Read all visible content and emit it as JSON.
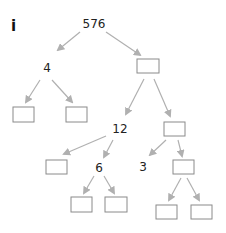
{
  "part_label": "i",
  "colors": {
    "edge": "#b0b0b0",
    "box_border": "#8a8a8a",
    "text": "#222222"
  },
  "nodes": {
    "root": "576",
    "left": "4",
    "right_mid": "12",
    "mid_child": "6",
    "right_leaf_num": "3"
  },
  "tree": {
    "value": "576",
    "children": [
      {
        "value": "4",
        "children": [
          {
            "value": ""
          },
          {
            "value": ""
          }
        ]
      },
      {
        "value": "",
        "children": [
          {
            "value": "12",
            "children": [
              {
                "value": ""
              },
              {
                "value": "6",
                "children": [
                  {
                    "value": ""
                  },
                  {
                    "value": ""
                  }
                ]
              }
            ]
          },
          {
            "value": "",
            "children": [
              {
                "value": "3"
              },
              {
                "value": "",
                "children": [
                  {
                    "value": ""
                  },
                  {
                    "value": ""
                  }
                ]
              }
            ]
          }
        ]
      }
    ]
  }
}
